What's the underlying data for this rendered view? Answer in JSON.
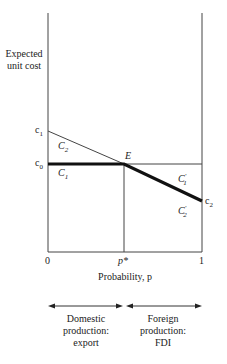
{
  "diagram": {
    "y_axis_label_line1": "Expected",
    "y_axis_label_line2": "unit cost",
    "x_axis_label": "Probability, p",
    "x_ticks": {
      "zero": "0",
      "pstar": "p*",
      "one": "1"
    },
    "y_ticks": {
      "c1": "c",
      "c1_sub": "1",
      "c0": "c",
      "c0_sub": "0"
    },
    "right_tick": {
      "c2": "c",
      "c2_sub": "2"
    },
    "point_label": "E",
    "region_labels": {
      "C2": {
        "base": "C",
        "sub": "2"
      },
      "C1": {
        "base": "C",
        "sub": "1"
      },
      "C1p": {
        "base": "C",
        "sub": "1",
        "prime": "′"
      },
      "C2p": {
        "base": "C",
        "sub": "2",
        "prime": "′"
      }
    },
    "regimes": [
      {
        "line1": "Domestic",
        "line2": "production:",
        "line3": "export"
      },
      {
        "line1": "Foreign",
        "line2": "production:",
        "line3": "FDI"
      }
    ]
  }
}
